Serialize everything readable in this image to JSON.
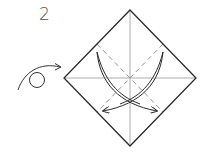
{
  "diagram": {
    "type": "origami-instruction-step",
    "step_number": "2",
    "symbols": {
      "turn_over": "turn-over-icon",
      "valley_fold_arrows": 2
    },
    "colors": {
      "outline": "#2b2b2b",
      "crease": "#9a9a9a",
      "dashed_fold": "#8a8a8a",
      "arrow": "#2b2b2b",
      "step_number": "#555555"
    },
    "paper": {
      "shape": "square-diamond",
      "vertices": {
        "top": [
          130,
          10
        ],
        "right": [
          196,
          78
        ],
        "bottom": [
          130,
          146
        ],
        "left": [
          64,
          78
        ]
      },
      "creases": [
        "horizontal-diagonal",
        "vertical-diagonal"
      ],
      "valley_folds": [
        {
          "from": [
            97,
            44
          ],
          "to": [
            163,
            112
          ]
        },
        {
          "from": [
            163,
            44
          ],
          "to": [
            97,
            112
          ]
        }
      ]
    }
  }
}
